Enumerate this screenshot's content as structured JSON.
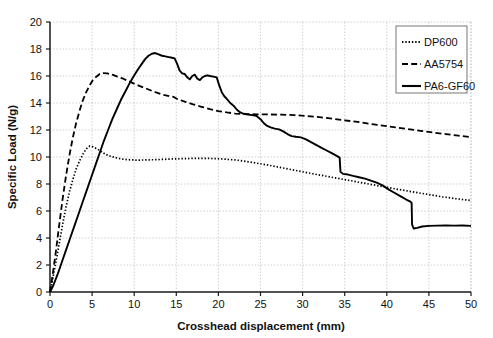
{
  "chart_data": {
    "type": "line",
    "title": "",
    "xlabel": "Crosshead displacement (mm)",
    "ylabel": "Specific Load (N/g)",
    "xlim": [
      0,
      50
    ],
    "ylim": [
      0,
      20
    ],
    "xticks": [
      0,
      5,
      10,
      15,
      20,
      25,
      30,
      35,
      40,
      45,
      50
    ],
    "yticks": [
      0,
      2,
      4,
      6,
      8,
      10,
      12,
      14,
      16,
      18,
      20
    ],
    "xtick_labels": [
      "0",
      "5",
      "10",
      "15",
      "20",
      "25",
      "30",
      "35",
      "40",
      "45",
      "50"
    ],
    "ytick_labels": [
      "0",
      "2",
      "4",
      "6",
      "8",
      "10",
      "12",
      "14",
      "16",
      "18",
      "20"
    ],
    "grid": true,
    "grid_style": "dotted",
    "legend_position": "top-right",
    "series": [
      {
        "name": "DP600",
        "style": "dotted",
        "color": "#000000",
        "points": [
          [
            0.0,
            0.0
          ],
          [
            0.3,
            0.9
          ],
          [
            0.7,
            2.2
          ],
          [
            1.1,
            3.6
          ],
          [
            1.5,
            5.0
          ],
          [
            1.9,
            6.3
          ],
          [
            2.3,
            7.4
          ],
          [
            2.7,
            8.3
          ],
          [
            3.1,
            9.1
          ],
          [
            3.5,
            9.7
          ],
          [
            3.9,
            10.2
          ],
          [
            4.3,
            10.6
          ],
          [
            4.7,
            10.8
          ],
          [
            5.1,
            10.75
          ],
          [
            5.6,
            10.6
          ],
          [
            6.1,
            10.4
          ],
          [
            6.6,
            10.2
          ],
          [
            7.2,
            10.05
          ],
          [
            7.8,
            9.95
          ],
          [
            8.5,
            9.85
          ],
          [
            9.3,
            9.8
          ],
          [
            10.2,
            9.77
          ],
          [
            11.2,
            9.78
          ],
          [
            12.4,
            9.8
          ],
          [
            13.6,
            9.83
          ],
          [
            14.8,
            9.86
          ],
          [
            16.0,
            9.88
          ],
          [
            17.2,
            9.9
          ],
          [
            18.4,
            9.9
          ],
          [
            19.6,
            9.88
          ],
          [
            20.8,
            9.84
          ],
          [
            22.0,
            9.78
          ],
          [
            23.2,
            9.68
          ],
          [
            24.4,
            9.56
          ],
          [
            25.6,
            9.43
          ],
          [
            27.0,
            9.27
          ],
          [
            28.4,
            9.1
          ],
          [
            29.8,
            8.93
          ],
          [
            31.2,
            8.76
          ],
          [
            32.6,
            8.6
          ],
          [
            34.0,
            8.44
          ],
          [
            35.4,
            8.28
          ],
          [
            36.8,
            8.12
          ],
          [
            38.2,
            7.96
          ],
          [
            39.6,
            7.8
          ],
          [
            41.0,
            7.64
          ],
          [
            42.4,
            7.49
          ],
          [
            43.8,
            7.34
          ],
          [
            45.2,
            7.2
          ],
          [
            46.6,
            7.05
          ],
          [
            48.0,
            6.93
          ],
          [
            49.0,
            6.85
          ],
          [
            50.0,
            6.78
          ]
        ]
      },
      {
        "name": "AA5754",
        "style": "dashed",
        "color": "#000000",
        "points": [
          [
            0.0,
            0.0
          ],
          [
            0.3,
            1.2
          ],
          [
            0.7,
            3.0
          ],
          [
            1.1,
            5.0
          ],
          [
            1.5,
            6.9
          ],
          [
            1.9,
            8.6
          ],
          [
            2.3,
            10.1
          ],
          [
            2.7,
            11.4
          ],
          [
            3.1,
            12.5
          ],
          [
            3.5,
            13.4
          ],
          [
            3.9,
            14.2
          ],
          [
            4.3,
            14.8
          ],
          [
            4.7,
            15.3
          ],
          [
            5.1,
            15.7
          ],
          [
            5.5,
            15.95
          ],
          [
            5.9,
            16.15
          ],
          [
            6.3,
            16.22
          ],
          [
            6.8,
            16.2
          ],
          [
            7.4,
            16.1
          ],
          [
            8.0,
            15.95
          ],
          [
            8.7,
            15.8
          ],
          [
            9.4,
            15.6
          ],
          [
            10.1,
            15.4
          ],
          [
            10.9,
            15.2
          ],
          [
            11.7,
            15.0
          ],
          [
            12.6,
            14.78
          ],
          [
            13.5,
            14.6
          ],
          [
            14.3,
            14.48
          ],
          [
            14.7,
            14.45
          ],
          [
            15.1,
            14.3
          ],
          [
            16.0,
            14.1
          ],
          [
            17.0,
            13.9
          ],
          [
            18.0,
            13.72
          ],
          [
            19.0,
            13.55
          ],
          [
            20.0,
            13.4
          ],
          [
            21.0,
            13.3
          ],
          [
            22.0,
            13.22
          ],
          [
            23.2,
            13.18
          ],
          [
            24.5,
            13.16
          ],
          [
            26.0,
            13.15
          ],
          [
            27.5,
            13.14
          ],
          [
            29.0,
            13.1
          ],
          [
            30.5,
            13.04
          ],
          [
            32.0,
            12.95
          ],
          [
            33.5,
            12.84
          ],
          [
            35.0,
            12.72
          ],
          [
            36.5,
            12.6
          ],
          [
            38.0,
            12.46
          ],
          [
            39.5,
            12.33
          ],
          [
            41.0,
            12.2
          ],
          [
            42.5,
            12.07
          ],
          [
            44.0,
            11.94
          ],
          [
            45.5,
            11.81
          ],
          [
            47.0,
            11.7
          ],
          [
            48.5,
            11.58
          ],
          [
            50.0,
            11.48
          ]
        ]
      },
      {
        "name": "PA6-GF60",
        "style": "solid",
        "color": "#000000",
        "points": [
          [
            0.0,
            0.0
          ],
          [
            0.4,
            0.5
          ],
          [
            0.9,
            1.3
          ],
          [
            1.4,
            2.2
          ],
          [
            1.9,
            3.1
          ],
          [
            2.4,
            4.0
          ],
          [
            2.9,
            4.9
          ],
          [
            3.4,
            5.8
          ],
          [
            3.9,
            6.7
          ],
          [
            4.4,
            7.6
          ],
          [
            4.9,
            8.5
          ],
          [
            5.4,
            9.4
          ],
          [
            5.9,
            10.3
          ],
          [
            6.4,
            11.2
          ],
          [
            6.9,
            12.0
          ],
          [
            7.4,
            12.8
          ],
          [
            7.9,
            13.5
          ],
          [
            8.4,
            14.2
          ],
          [
            8.9,
            14.8
          ],
          [
            9.4,
            15.4
          ],
          [
            9.9,
            15.95
          ],
          [
            10.4,
            16.45
          ],
          [
            10.9,
            16.9
          ],
          [
            11.3,
            17.25
          ],
          [
            11.7,
            17.5
          ],
          [
            12.1,
            17.65
          ],
          [
            12.5,
            17.7
          ],
          [
            12.9,
            17.6
          ],
          [
            13.3,
            17.5
          ],
          [
            13.7,
            17.45
          ],
          [
            14.1,
            17.4
          ],
          [
            14.5,
            17.35
          ],
          [
            14.8,
            17.3
          ],
          [
            15.1,
            16.9
          ],
          [
            15.4,
            16.4
          ],
          [
            15.7,
            16.2
          ],
          [
            16.0,
            16.15
          ],
          [
            16.3,
            15.9
          ],
          [
            16.6,
            15.75
          ],
          [
            16.9,
            16.0
          ],
          [
            17.2,
            16.1
          ],
          [
            17.5,
            15.8
          ],
          [
            17.8,
            15.7
          ],
          [
            18.1,
            15.9
          ],
          [
            18.4,
            16.0
          ],
          [
            18.7,
            16.05
          ],
          [
            19.0,
            16.0
          ],
          [
            19.4,
            15.95
          ],
          [
            19.8,
            15.9
          ],
          [
            20.1,
            15.3
          ],
          [
            20.4,
            14.8
          ],
          [
            20.7,
            14.5
          ],
          [
            21.0,
            14.3
          ],
          [
            21.4,
            14.0
          ],
          [
            21.8,
            13.8
          ],
          [
            22.2,
            13.5
          ],
          [
            22.6,
            13.3
          ],
          [
            23.0,
            13.2
          ],
          [
            23.5,
            13.15
          ],
          [
            24.0,
            13.1
          ],
          [
            24.5,
            13.05
          ],
          [
            25.0,
            12.8
          ],
          [
            25.4,
            12.5
          ],
          [
            25.8,
            12.3
          ],
          [
            26.2,
            12.2
          ],
          [
            26.7,
            12.1
          ],
          [
            27.2,
            12.05
          ],
          [
            27.7,
            11.9
          ],
          [
            28.2,
            11.7
          ],
          [
            28.7,
            11.55
          ],
          [
            29.2,
            11.5
          ],
          [
            29.8,
            11.45
          ],
          [
            30.4,
            11.3
          ],
          [
            31.0,
            11.1
          ],
          [
            31.6,
            10.9
          ],
          [
            32.2,
            10.7
          ],
          [
            32.8,
            10.5
          ],
          [
            33.4,
            10.3
          ],
          [
            34.0,
            10.1
          ],
          [
            34.4,
            9.95
          ],
          [
            34.5,
            8.9
          ],
          [
            34.8,
            8.75
          ],
          [
            35.4,
            8.7
          ],
          [
            36.0,
            8.6
          ],
          [
            36.7,
            8.5
          ],
          [
            37.4,
            8.4
          ],
          [
            38.1,
            8.25
          ],
          [
            38.8,
            8.1
          ],
          [
            39.5,
            7.9
          ],
          [
            40.2,
            7.6
          ],
          [
            40.9,
            7.35
          ],
          [
            41.6,
            7.1
          ],
          [
            42.3,
            6.85
          ],
          [
            42.8,
            6.7
          ],
          [
            42.95,
            6.6
          ],
          [
            43.0,
            5.0
          ],
          [
            43.2,
            4.7
          ],
          [
            43.6,
            4.75
          ],
          [
            44.2,
            4.85
          ],
          [
            45.0,
            4.9
          ],
          [
            46.0,
            4.92
          ],
          [
            47.0,
            4.93
          ],
          [
            48.0,
            4.92
          ],
          [
            49.0,
            4.93
          ],
          [
            50.0,
            4.9
          ]
        ]
      }
    ]
  },
  "legend": {
    "items": [
      {
        "label": "DP600",
        "style": "dotted"
      },
      {
        "label": "AA5754",
        "style": "dashed"
      },
      {
        "label": "PA6-GF60",
        "style": "solid"
      }
    ]
  }
}
